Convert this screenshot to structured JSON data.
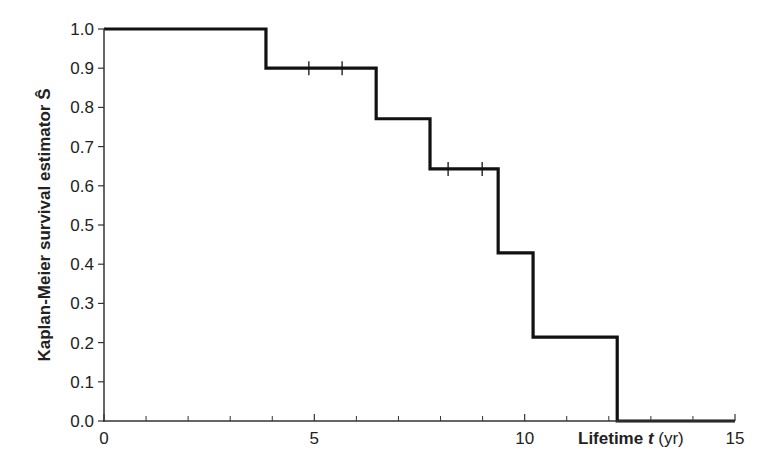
{
  "chart_data": {
    "type": "line",
    "subtype": "step",
    "title": "",
    "xlabel": "Lifetime t (yr)",
    "xlabel_parts": {
      "main": "Lifetime ",
      "var": "t",
      "unit": " (yr)"
    },
    "ylabel": "Kaplan-Meier survival estimator Ŝ",
    "xlim": [
      0,
      15
    ],
    "ylim": [
      0,
      1.0
    ],
    "x_ticks": [
      0,
      5,
      10,
      15
    ],
    "x_tick_labels": [
      "0",
      "5",
      "10",
      "15"
    ],
    "x_minor_ticks": [
      1,
      2,
      3,
      4,
      6,
      7,
      8,
      9,
      11,
      12,
      13,
      14
    ],
    "y_ticks": [
      0.0,
      0.1,
      0.2,
      0.3,
      0.4,
      0.5,
      0.6,
      0.7,
      0.8,
      0.9,
      1.0
    ],
    "y_tick_labels": [
      "0.0",
      "0.1",
      "0.2",
      "0.3",
      "0.4",
      "0.5",
      "0.6",
      "0.7",
      "0.8",
      "0.9",
      "1.0"
    ],
    "grid": false,
    "legend": null,
    "series": [
      {
        "name": "Kaplan-Meier survival estimate",
        "step_times": [
          0,
          3.85,
          6.47,
          7.75,
          9.37,
          10.2,
          12.2,
          15
        ],
        "survival": [
          1.0,
          0.9,
          0.771,
          0.643,
          0.429,
          0.214,
          0.0,
          0.0
        ],
        "censored_times": [
          4.87,
          5.66,
          8.18,
          8.99
        ],
        "censored_values": [
          0.9,
          0.9,
          0.643,
          0.643
        ]
      }
    ],
    "colors": {
      "line": "#111111",
      "axis": "#333333",
      "text": "#222222"
    }
  }
}
